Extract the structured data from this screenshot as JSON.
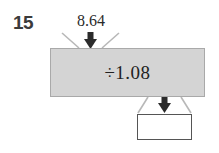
{
  "question": {
    "number": "15"
  },
  "diagram": {
    "type": "function-machine",
    "input": {
      "label": "8.64",
      "icon": "down-arrow-icon"
    },
    "operation": {
      "label": "÷1.08",
      "fill_color": "#d4d4d4",
      "border_color": "#a9a9a9"
    },
    "output": {
      "label": "",
      "icon": "down-arrow-icon",
      "fill_color": "#ffffff",
      "border_color": "#555555"
    },
    "funnel_color": "#b8b8b8",
    "arrow_color": "#2b2b2b",
    "background_color": "#ffffff"
  }
}
